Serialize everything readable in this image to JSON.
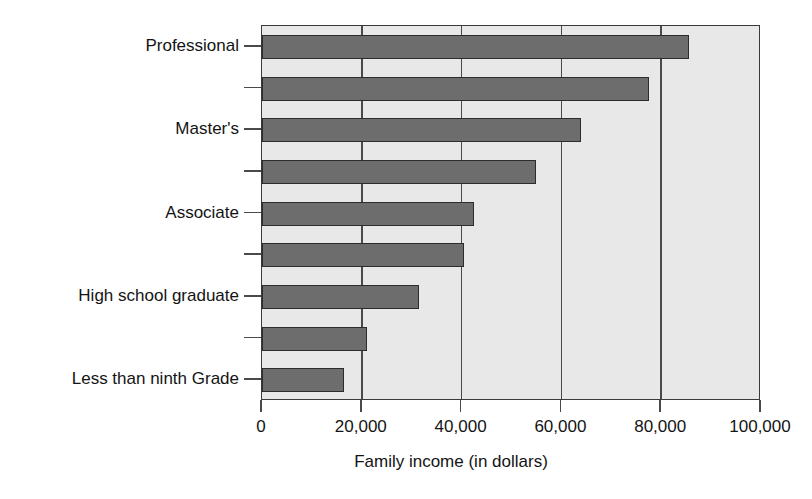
{
  "chart_data": {
    "type": "bar",
    "orientation": "horizontal",
    "title": "",
    "xlabel": "Family income (in dollars)",
    "ylabel": "",
    "xlim": [
      0,
      100000
    ],
    "xticks": [
      0,
      20000,
      40000,
      60000,
      80000,
      100000
    ],
    "xticklabels": [
      "0",
      "20,000",
      "40,000",
      "60,000",
      "80,000",
      "100,000"
    ],
    "grid": true,
    "legend": false,
    "categories": [
      "Professional",
      "",
      "Master's",
      "",
      "Associate",
      "",
      "High school graduate",
      "",
      "Less than ninth Grade"
    ],
    "visible_category_labels": [
      "Professional",
      "Master's",
      "Associate",
      "High school graduate",
      "Less than ninth Grade"
    ],
    "values": [
      85500,
      77500,
      64000,
      55000,
      42500,
      40500,
      31500,
      21000,
      16500
    ],
    "bar_color": "#6d6d6d",
    "bar_edge_color": "#2c2c2c",
    "plot_background": "#e8e8e8",
    "axis_color": "#3a3a3a"
  },
  "axis": {
    "x_title": "Family income (in dollars)"
  }
}
